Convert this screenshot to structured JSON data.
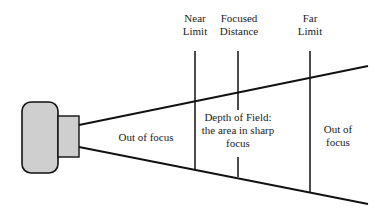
{
  "diagram": {
    "title": "Depth of Field",
    "markers": [
      {
        "id": "near",
        "line1": "Near",
        "line2": "Limit"
      },
      {
        "id": "focused",
        "line1": "Focused",
        "line2": "Distance"
      },
      {
        "id": "far",
        "line1": "Far",
        "line2": "Limit"
      }
    ],
    "regions": {
      "near_out": "Out of focus",
      "dof_line1": "Depth of Field:",
      "dof_line2": "the area in sharp",
      "dof_line3": "focus",
      "far_out_line1": "Out of",
      "far_out_line2": "focus"
    },
    "colors": {
      "stroke": "#111111",
      "camera_fill": "#cfcfcf"
    }
  }
}
